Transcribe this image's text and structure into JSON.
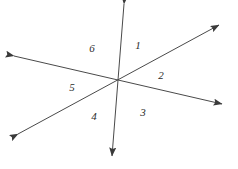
{
  "figure": {
    "background_color": "#ffffff",
    "stroke_color": "#4a4a4a",
    "label_color": "#2b2b2b",
    "stroke_width": 1,
    "canvas": {
      "width": 238,
      "height": 169
    },
    "intersection": {
      "x": 118,
      "y": 81
    },
    "lines": [
      {
        "name": "vertical-line",
        "from": {
          "x": 124,
          "y": 4
        },
        "to": {
          "x": 112,
          "y": 156
        },
        "arrow_start": true,
        "arrow_end": true
      },
      {
        "name": "rising-diagonal-line",
        "from": {
          "x": 18,
          "y": 134
        },
        "to": {
          "x": 219,
          "y": 25
        },
        "arrow_start": true,
        "arrow_end": true
      },
      {
        "name": "falling-diagonal-line",
        "from": {
          "x": 14,
          "y": 56
        },
        "to": {
          "x": 222,
          "y": 104
        },
        "arrow_start": true,
        "arrow_end": true
      }
    ],
    "labels": [
      {
        "name": "angle-label-1",
        "text": "1",
        "x": 138,
        "y": 45
      },
      {
        "name": "angle-label-2",
        "text": "2",
        "x": 161,
        "y": 75
      },
      {
        "name": "angle-label-3",
        "text": "3",
        "x": 143,
        "y": 112
      },
      {
        "name": "angle-label-4",
        "text": "4",
        "x": 94,
        "y": 116
      },
      {
        "name": "angle-label-5",
        "text": "5",
        "x": 72,
        "y": 87
      },
      {
        "name": "angle-label-6",
        "text": "6",
        "x": 92,
        "y": 48
      }
    ]
  }
}
